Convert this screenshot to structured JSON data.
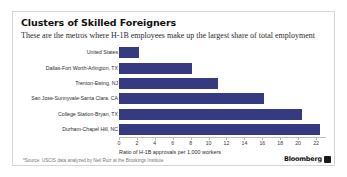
{
  "card": {
    "title": "Clusters of Skilled Foreigners",
    "subtitle": "These are the metros where H-1B employees make up the largest share of total employment",
    "source_note": "*Source: USCIS data analyzed by Neil Ruiz at the Brookings Institute"
  },
  "branding": {
    "wordmark": "Bloomberg",
    "mark_icon": "bloomberg-square-icon",
    "mark_color": "#1a1a1a"
  },
  "chart_data": {
    "type": "bar",
    "orientation": "horizontal",
    "title": "Clusters of Skilled Foreigners",
    "subtitle": "These are the metros where H-1B employees make up the largest share of total employment",
    "xlabel": "Ratio of H-1B approvals per 1,000 workers",
    "ylabel": "",
    "xlim": [
      0,
      23
    ],
    "xticks": [
      0,
      2,
      4,
      6,
      8,
      10,
      12,
      14,
      16,
      18,
      20,
      22
    ],
    "grid": false,
    "legend": null,
    "bar_color": "#363a80",
    "categories": [
      "United States",
      "Dallas-Fort Worth-Arlington, TX",
      "Trenton-Ewing, NJ",
      "San Jose-Sunnyvale-Santa Clara, CA",
      "College Station-Bryan, TX",
      "Durham-Chapel Hill, NC"
    ],
    "values": [
      2.2,
      8.1,
      11.1,
      16.2,
      20.4,
      22.4
    ]
  }
}
